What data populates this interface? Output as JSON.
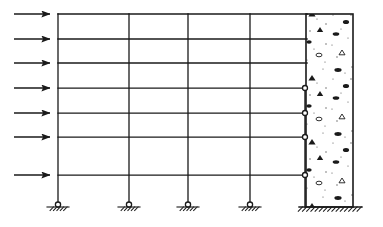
{
  "figure": {
    "type": "structural-elevation-diagram",
    "stroke_color": "#1a1a1a",
    "background_color": "#ffffff",
    "canvas": {
      "width": 383,
      "height": 227
    }
  },
  "geometry": {
    "frame_left_x": 58,
    "column_x": [
      58,
      129,
      188,
      250,
      305
    ],
    "beam_levels_y": [
      14,
      39,
      63,
      88,
      113,
      137,
      175
    ],
    "ground_y": 207,
    "wall": {
      "left_x": 306,
      "right_x": 353,
      "top_y": 14,
      "base_y": 207,
      "label": "reinforced-concrete-shear-wall",
      "fill_pattern": "concrete-aggregate"
    }
  },
  "loads": {
    "label": "lateral-load-arrows",
    "direction": "right",
    "count": 7,
    "tail_x": 14,
    "head_x": 50,
    "y": [
      14,
      39,
      63,
      88,
      113,
      137,
      175
    ]
  },
  "supports": {
    "pinned": {
      "label": "pinned-support",
      "symbol": "circle-on-hatched-ground",
      "x": [
        58,
        129,
        188,
        250
      ],
      "y": 207
    },
    "fixed": {
      "label": "fixed-base-support",
      "symbol": "hatched-ground-line",
      "x_start": 299,
      "x_end": 362,
      "y": 207
    }
  },
  "connections": {
    "pinned_beam_to_wall": {
      "label": "hinge-connection",
      "symbol": "small-open-circle",
      "x": 305,
      "y": [
        88,
        113,
        137,
        175
      ]
    },
    "rigid_beam_to_wall": {
      "label": "rigid-connection",
      "y": [
        14,
        39,
        63
      ]
    }
  },
  "chart_data": {
    "type": "diagram",
    "series": [
      {
        "name": "beam-levels",
        "values": [
          14,
          39,
          63,
          88,
          113,
          137,
          175
        ]
      },
      {
        "name": "column-lines",
        "values": [
          58,
          129,
          188,
          250,
          305
        ]
      },
      {
        "name": "lateral-loads",
        "values": [
          14,
          39,
          63,
          88,
          113,
          137,
          175
        ]
      }
    ]
  }
}
